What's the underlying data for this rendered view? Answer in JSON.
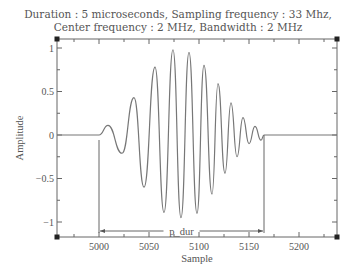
{
  "chart_data": {
    "type": "line",
    "title_lines": [
      "Duration : 5 microseconds, Sampling frequency : 33 Mhz,",
      "Center frequency : 2 MHz, Bandwidth : 2 MHz"
    ],
    "xlabel": "Sample",
    "ylabel": "Amplitude",
    "xlim": [
      4958,
      5238
    ],
    "ylim": [
      -1.1,
      1.1
    ],
    "xticks": [
      5000,
      5050,
      5100,
      5150,
      5200
    ],
    "yticks": [
      1,
      0.5,
      0,
      -0.5,
      -1
    ],
    "ytick_labels": [
      "1",
      "0.5",
      "0",
      "−0.5",
      "−1"
    ],
    "grid": false,
    "annotation": {
      "text": "p_dur",
      "from": 5000,
      "to": 5165,
      "y": -1
    },
    "series": [
      {
        "name": "pulse",
        "x": [
          4958,
          5000,
          5009,
          5023,
          5035,
          5045,
          5056,
          5065,
          5074,
          5082,
          5090,
          5098,
          5105,
          5113,
          5119,
          5126,
          5132,
          5138,
          5144,
          5150,
          5156,
          5162,
          5165,
          5165,
          5238
        ],
        "y": [
          0,
          0,
          0.11,
          -0.21,
          0.43,
          -0.6,
          0.78,
          -0.89,
          0.98,
          -0.95,
          0.95,
          -0.9,
          0.8,
          -0.68,
          0.59,
          -0.44,
          0.37,
          -0.25,
          0.2,
          -0.1,
          0.1,
          -0.06,
          0,
          0,
          0
        ]
      }
    ]
  }
}
